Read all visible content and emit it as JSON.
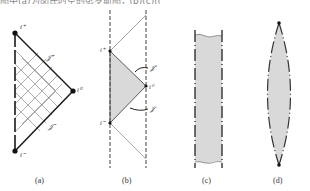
{
  "top_text": "图中(a)为闵氏时空的彭罗斯图，(b)(c)(d)为其它时空的共形图示意",
  "panels": [
    {
      "id": "a",
      "caption": "(a)",
      "labels": {
        "i_plus": "i⁺",
        "i_zero": "i⁰",
        "i_minus": "i⁻",
        "scri_plus": "𝒥⁺",
        "scri_minus": "𝒥⁻"
      }
    },
    {
      "id": "b",
      "caption": "(b)",
      "labels": {
        "i_plus": "i⁺",
        "i_zero": "i⁰",
        "i_minus": "i⁻",
        "scri_plus": "𝒥⁺",
        "scri_minus": "𝒥⁻"
      }
    },
    {
      "id": "c",
      "caption": "(c)"
    },
    {
      "id": "d",
      "caption": "(d)"
    }
  ],
  "colors": {
    "line": "#1a1a1a",
    "fill": "#d9d9d9",
    "grid": "#777777",
    "thin": "#666666"
  }
}
